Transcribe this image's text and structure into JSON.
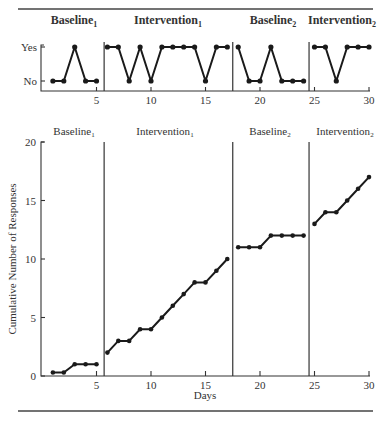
{
  "chart_data": [
    {
      "type": "line",
      "title": "",
      "xlabel": "",
      "ylabel": "",
      "y_categories": [
        "No",
        "Yes"
      ],
      "x_ticks": [
        5,
        10,
        15,
        20,
        25,
        30
      ],
      "xlim": [
        0,
        30
      ],
      "phases": [
        {
          "label": "Baseline",
          "subscript": "1",
          "days": [
            1,
            5
          ]
        },
        {
          "label": "Intervention",
          "subscript": "1",
          "days": [
            6,
            17
          ]
        },
        {
          "label": "Baseline",
          "subscript": "2",
          "days": [
            18,
            24
          ]
        },
        {
          "label": "Intervention",
          "subscript": "2",
          "days": [
            25,
            30
          ]
        }
      ],
      "phase_change_lines_after_day": [
        5.7,
        17.5,
        24.5
      ],
      "series": [
        {
          "name": "Baseline1",
          "x": [
            1,
            2,
            3,
            4,
            5
          ],
          "values": [
            "No",
            "No",
            "Yes",
            "No",
            "No"
          ]
        },
        {
          "name": "Intervention1",
          "x": [
            6,
            7,
            8,
            9,
            10,
            11,
            12,
            13,
            14,
            15,
            16,
            17
          ],
          "values": [
            "Yes",
            "Yes",
            "No",
            "Yes",
            "No",
            "Yes",
            "Yes",
            "Yes",
            "Yes",
            "No",
            "Yes",
            "Yes"
          ]
        },
        {
          "name": "Baseline2",
          "x": [
            18,
            19,
            20,
            21,
            22,
            23,
            24
          ],
          "values": [
            "Yes",
            "No",
            "No",
            "Yes",
            "No",
            "No",
            "No"
          ]
        },
        {
          "name": "Intervention2",
          "x": [
            25,
            26,
            27,
            28,
            29,
            30
          ],
          "values": [
            "Yes",
            "Yes",
            "No",
            "Yes",
            "Yes",
            "Yes"
          ]
        }
      ],
      "grid": false
    },
    {
      "type": "line",
      "title": "",
      "xlabel": "Days",
      "ylabel": "Cumulative Number of Responses",
      "xlim": [
        0,
        30
      ],
      "ylim": [
        0,
        20
      ],
      "x_ticks": [
        5,
        10,
        15,
        20,
        25,
        30
      ],
      "y_ticks": [
        0,
        5,
        10,
        15,
        20
      ],
      "phases": [
        {
          "label": "Baseline",
          "subscript": "1",
          "days": [
            1,
            5
          ]
        },
        {
          "label": "Intervention",
          "subscript": "1",
          "days": [
            6,
            17
          ]
        },
        {
          "label": "Baseline",
          "subscript": "2",
          "days": [
            18,
            24
          ]
        },
        {
          "label": "Intervention",
          "subscript": "2",
          "days": [
            25,
            30
          ]
        }
      ],
      "phase_change_lines_after_day": [
        5.7,
        17.5,
        24.5
      ],
      "series": [
        {
          "name": "Baseline1",
          "x": [
            1,
            2,
            3,
            4,
            5
          ],
          "values": [
            0.3,
            0.3,
            1,
            1,
            1
          ]
        },
        {
          "name": "Intervention1",
          "x": [
            6,
            7,
            8,
            9,
            10,
            11,
            12,
            13,
            14,
            15,
            16,
            17
          ],
          "values": [
            2,
            3,
            3,
            4,
            4,
            5,
            6,
            7,
            8,
            8,
            9,
            10
          ]
        },
        {
          "name": "Baseline2",
          "x": [
            18,
            19,
            20,
            21,
            22,
            23,
            24
          ],
          "values": [
            11,
            11,
            11,
            12,
            12,
            12,
            12
          ]
        },
        {
          "name": "Intervention2",
          "x": [
            25,
            26,
            27,
            28,
            29,
            30
          ],
          "values": [
            13,
            14,
            14,
            15,
            16,
            17
          ]
        }
      ],
      "grid": false
    }
  ],
  "labels": {
    "top_y_yes": "Yes",
    "top_y_no": "No",
    "bottom_ylabel": "Cumulative Number of Responses",
    "bottom_xlabel": "Days"
  }
}
